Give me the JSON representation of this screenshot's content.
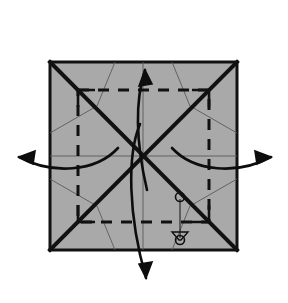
{
  "figure": {
    "kind": "origami-crease-pattern-diagram",
    "title": "Origami square crease pattern with four outward unfold arrows",
    "canvas": {
      "width": 288,
      "height": 303,
      "background": "#ffffff"
    }
  },
  "colors": {
    "paper_fill": "#a9a9a9",
    "paper_stroke": "#111111",
    "mountain_fold": "#111111",
    "valley_fold": "#111111",
    "thin_crease": "#5a5a5a",
    "arrow": "#0d0d0d",
    "marker": "#111111",
    "background": "#ffffff"
  },
  "paper": {
    "name": "square-sheet",
    "x": 50,
    "y": 62,
    "width": 187,
    "height": 188,
    "fill": "#a9a9a9",
    "stroke_width": 3
  },
  "folds": {
    "mountain_diagonals": [
      {
        "name": "diagonal-tl-br",
        "x1": 50,
        "y1": 62,
        "x2": 237,
        "y2": 250,
        "width": 4
      },
      {
        "name": "diagonal-bl-tr",
        "x1": 50,
        "y1": 250,
        "x2": 237,
        "y2": 62,
        "width": 4
      }
    ],
    "valley_square": {
      "name": "inner-dashed-square",
      "x": 78,
      "y": 90,
      "width": 131,
      "height": 132,
      "dash": "11 9",
      "width_px": 3
    },
    "thin_creases": [
      {
        "name": "center-horizontal-crease",
        "x1": 50,
        "y1": 156,
        "x2": 237,
        "y2": 156
      },
      {
        "name": "center-vertical-crease",
        "x1": 143,
        "y1": 62,
        "x2": 143,
        "y2": 250
      },
      {
        "name": "crease-tl-a",
        "x1": 50,
        "y1": 133,
        "x2": 97,
        "y2": 106
      },
      {
        "name": "crease-tl-b",
        "x1": 97,
        "y1": 106,
        "x2": 115,
        "y2": 62
      },
      {
        "name": "crease-tr-a",
        "x1": 237,
        "y1": 133,
        "x2": 190,
        "y2": 106
      },
      {
        "name": "crease-tr-b",
        "x1": 190,
        "y1": 106,
        "x2": 172,
        "y2": 62
      },
      {
        "name": "crease-bl-a",
        "x1": 50,
        "y1": 179,
        "x2": 97,
        "y2": 206
      },
      {
        "name": "crease-bl-b",
        "x1": 97,
        "y1": 206,
        "x2": 115,
        "y2": 250
      },
      {
        "name": "crease-br-a",
        "x1": 237,
        "y1": 179,
        "x2": 190,
        "y2": 206
      },
      {
        "name": "crease-br-b",
        "x1": 190,
        "y1": 206,
        "x2": 172,
        "y2": 250
      }
    ],
    "corner_flaps": [
      {
        "name": "flap-corner-tl",
        "path": "M 78 90 L 78 107 M 78 90 L 95 90"
      },
      {
        "name": "flap-corner-tr",
        "path": "M 209 90 L 209 107 M 209 90 L 192 90"
      },
      {
        "name": "flap-corner-bl",
        "path": "M 78 222 L 78 205 M 78 222 L 95 222"
      },
      {
        "name": "flap-corner-br",
        "path": "M 209 222 L 209 205 M 209 222 L 192 222"
      }
    ]
  },
  "arrows": [
    {
      "name": "unfold-arrow-up",
      "direction": "up",
      "label": "unfold upward",
      "path": "M 147 190 C 140 160 132 110 145 70",
      "head": "M 145 70 L 139 86 L 152 84 Z"
    },
    {
      "name": "unfold-arrow-down",
      "direction": "down",
      "label": "unfold downward",
      "path": "M 140 124 C 127 155 128 215 146 278",
      "head": "M 146 278 L 152 262 L 139 264 Z"
    },
    {
      "name": "unfold-arrow-left",
      "direction": "left",
      "label": "unfold leftward",
      "path": "M 118 148 C 96 172 52 175 19 157",
      "head": "M 19 157 L 35 151 L 33 164 Z"
    },
    {
      "name": "unfold-arrow-right",
      "direction": "right",
      "label": "unfold rightward",
      "path": "M 172 148 C 194 172 238 175 271 157",
      "head": "M 271 157 L 255 151 L 257 164 Z"
    }
  ],
  "markers": {
    "name": "alignment-reference-marker",
    "label": "matching points marker",
    "connector": {
      "x1": 180,
      "y1": 199,
      "x2": 180,
      "y2": 238
    },
    "points": [
      {
        "name": "reference-circle-upper",
        "cx": 180,
        "cy": 197,
        "r": 4.5
      },
      {
        "name": "reference-circle-lower",
        "cx": 180,
        "cy": 240,
        "r": 4.5
      }
    ],
    "bracket": {
      "name": "reference-bracket",
      "path": "M 172 232 L 188 232 L 181 240 L 179 240 Z"
    }
  }
}
